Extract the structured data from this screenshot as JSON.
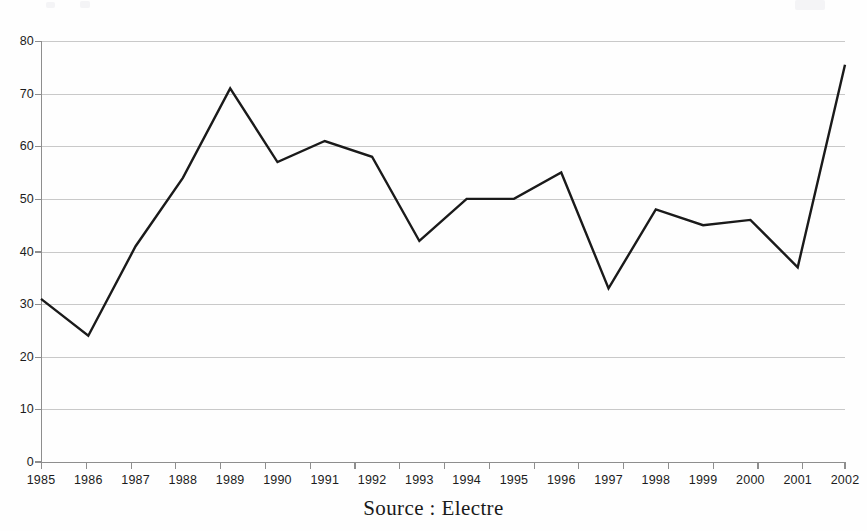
{
  "figure": {
    "background_color": "#fefefe",
    "caption": "Source : Electre",
    "caption_font": "serif"
  },
  "axes": {
    "line_color": "#9a9a9a",
    "grid_color": "#c9c9c9",
    "series_color": "#1a1a1a",
    "y_ticks": [
      "80",
      "70",
      "60",
      "50",
      "40",
      "30",
      "20",
      "10",
      "0"
    ],
    "x_ticks": [
      "1985",
      "1986",
      "1987",
      "1988",
      "1989",
      "1990",
      "1991",
      "1992",
      "1993",
      "1994",
      "1995",
      "1996",
      "1997",
      "1998",
      "1999",
      "2000",
      "2001",
      "2002"
    ]
  },
  "chart_data": {
    "type": "line",
    "title": "",
    "subtitle": "",
    "xlabel": "",
    "ylabel": "",
    "annotations": [
      "Source : Electre"
    ],
    "categories": [
      "1985",
      "1986",
      "1987",
      "1988",
      "1989",
      "1990",
      "1991",
      "1992",
      "1993",
      "1994",
      "1995",
      "1996",
      "1997",
      "1998",
      "1999",
      "2000",
      "2001",
      "2002"
    ],
    "values": [
      31,
      24,
      41,
      54,
      71,
      57,
      61,
      58,
      42,
      50,
      50,
      55,
      33,
      48,
      45,
      46,
      37,
      75.5
    ],
    "series": [
      {
        "name": "series-1",
        "color": "#1a1a1a",
        "values": [
          31,
          24,
          41,
          54,
          71,
          57,
          61,
          58,
          42,
          50,
          50,
          55,
          33,
          48,
          45,
          46,
          37,
          75.5
        ]
      }
    ],
    "ylim": [
      0,
      80
    ],
    "ytick_step": 10,
    "xlim": [
      "1985",
      "2002"
    ],
    "grid": "horizontal",
    "grid_on": true,
    "legend": "none",
    "markers": "none",
    "line_width": 2.4
  },
  "plot_geometry": {
    "left": 41,
    "right": 845,
    "top": 41,
    "bottom": 462
  }
}
